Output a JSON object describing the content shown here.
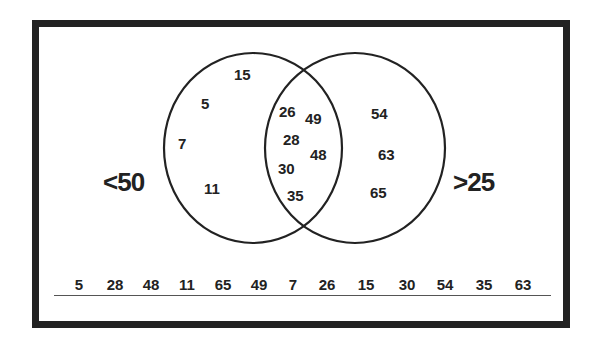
{
  "diagram": {
    "type": "venn",
    "colors": {
      "stroke": "#222222",
      "background": "#ffffff",
      "frame": "#222222"
    },
    "sets": [
      {
        "id": "left",
        "label": "<50",
        "members_only": [
          "15",
          "5",
          "7",
          "11"
        ]
      },
      {
        "id": "right",
        "label": ">25",
        "members_only": [
          "54",
          "63",
          "65"
        ]
      }
    ],
    "intersection": [
      "26",
      "49",
      "28",
      "48",
      "30",
      "35"
    ],
    "left_region": [
      {
        "value": "15",
        "x": 234,
        "y": 67
      },
      {
        "value": "5",
        "x": 201,
        "y": 96
      },
      {
        "value": "7",
        "x": 178,
        "y": 136
      },
      {
        "value": "11",
        "x": 204,
        "y": 181
      }
    ],
    "intersection_region": [
      {
        "value": "26",
        "x": 279,
        "y": 104
      },
      {
        "value": "49",
        "x": 305,
        "y": 111
      },
      {
        "value": "28",
        "x": 283,
        "y": 132
      },
      {
        "value": "48",
        "x": 310,
        "y": 147
      },
      {
        "value": "30",
        "x": 278,
        "y": 161
      },
      {
        "value": "35",
        "x": 287,
        "y": 188
      }
    ],
    "right_region": [
      {
        "value": "54",
        "x": 371,
        "y": 106
      },
      {
        "value": "63",
        "x": 378,
        "y": 147
      },
      {
        "value": "65",
        "x": 370,
        "y": 185
      }
    ],
    "number_line": [
      "5",
      "28",
      "48",
      "11",
      "65",
      "49",
      "7",
      "26",
      "15",
      "30",
      "54",
      "35",
      "63"
    ]
  }
}
